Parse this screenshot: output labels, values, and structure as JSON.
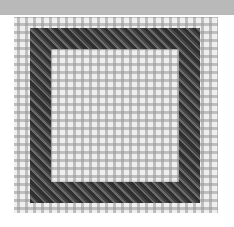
{
  "image": {
    "description": "Photo of needlepoint canvas with a square slanted-stitch border",
    "colors": {
      "top_bar": "#b9b9b9",
      "canvas": "#efefef",
      "canvas_grid": "#969696",
      "stitch_dark": "#2f2f2f",
      "stitch_light": "#6a6a6a"
    }
  }
}
